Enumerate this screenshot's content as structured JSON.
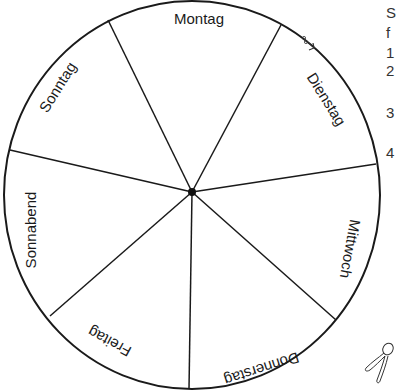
{
  "wheel": {
    "title": "Wochentage-Rad",
    "days": [
      {
        "label": "Montag"
      },
      {
        "label": "Dienstag"
      },
      {
        "label": "Mittwoch"
      },
      {
        "label": "Donnerstag"
      },
      {
        "label": "Freitag"
      },
      {
        "label": "Sonnabend"
      },
      {
        "label": "Sonntag"
      }
    ],
    "stroke_color": "#1a1a1a",
    "icons": {
      "cut_mark": "scissors-icon",
      "fastener": "split-pin-icon"
    }
  },
  "side_text": {
    "chars": [
      "S",
      "f",
      "1",
      "2",
      "3",
      "4"
    ]
  }
}
